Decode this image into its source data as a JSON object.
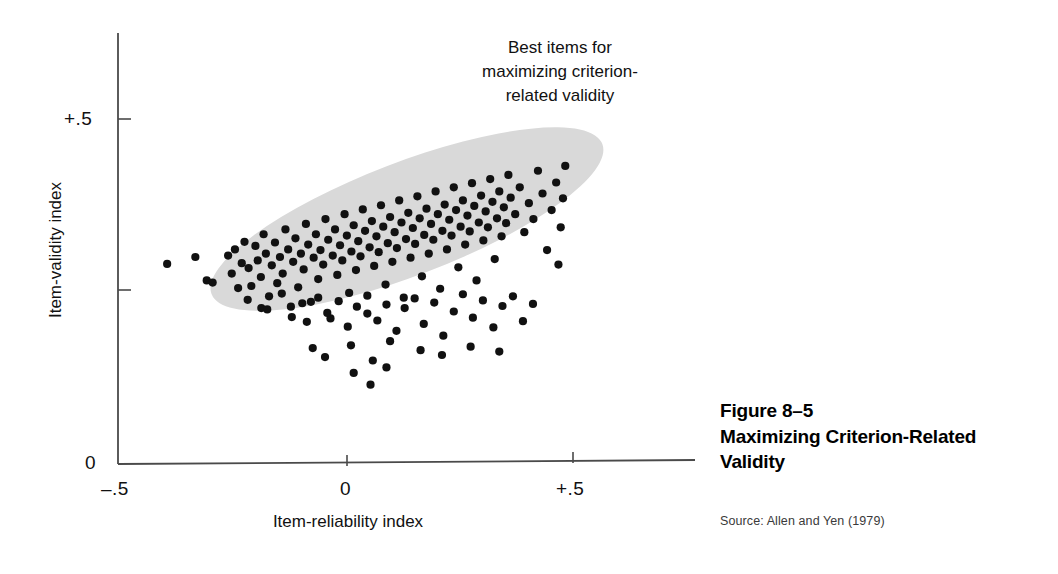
{
  "figure": {
    "caption_number": "Figure 8–5",
    "caption_title_line1": "Maximizing Criterion-Related",
    "caption_title_line2": "Validity",
    "source": "Source: Allen and Yen (1979)"
  },
  "annotation": {
    "line1": "Best items for",
    "line2": "maximizing criterion-",
    "line3": "related validity"
  },
  "axes": {
    "x_label": "Item-reliability index",
    "y_label": "Item-validity index",
    "x_ticks": [
      "–.5",
      "0",
      "+.5"
    ],
    "y_ticks": [
      "+.5",
      "0"
    ]
  },
  "colors": {
    "point": "#111111",
    "ellipse": "#d9d9d9",
    "axis": "#444444",
    "background": "#ffffff",
    "caption": "#000000",
    "source": "#3a3a3a"
  },
  "chart_data": {
    "type": "scatter",
    "title": "Maximizing Criterion-Related Validity",
    "xlabel": "Item-reliability index",
    "ylabel": "Item-validity index",
    "xlim": [
      -0.5,
      0.75
    ],
    "ylim": [
      0.0,
      0.6
    ],
    "x_tick_values": [
      -0.5,
      0.0,
      0.5
    ],
    "x_tick_labels": [
      "–.5",
      "0",
      "+.5"
    ],
    "y_tick_values": [
      0.0,
      0.5
    ],
    "y_tick_labels": [
      "0",
      "+.5"
    ],
    "grid": false,
    "legend": null,
    "annotations": [
      {
        "text": "Best items for maximizing criterion-related validity",
        "x": 0.45,
        "y": 0.62,
        "align": "center"
      }
    ],
    "highlight_region": {
      "shape": "ellipse",
      "label": "Best items for maximizing criterion-related validity",
      "fill": "#d9d9d9",
      "center_x": 0.135,
      "center_y": 0.355,
      "semi_major": 0.46,
      "semi_minor": 0.082,
      "rotation_deg": -21
    },
    "series": [
      {
        "name": "Test items",
        "marker": "circle",
        "color": "#111111",
        "n_points": 175,
        "points": [
          [
            -0.392,
            0.29
          ],
          [
            -0.33,
            0.3
          ],
          [
            -0.305,
            0.266
          ],
          [
            -0.292,
            0.263
          ],
          [
            -0.258,
            0.302
          ],
          [
            -0.25,
            0.276
          ],
          [
            -0.243,
            0.311
          ],
          [
            -0.236,
            0.255
          ],
          [
            -0.228,
            0.291
          ],
          [
            -0.222,
            0.322
          ],
          [
            -0.213,
            0.284
          ],
          [
            -0.207,
            0.258
          ],
          [
            -0.198,
            0.316
          ],
          [
            -0.193,
            0.295
          ],
          [
            -0.186,
            0.271
          ],
          [
            -0.18,
            0.333
          ],
          [
            -0.175,
            0.305
          ],
          [
            -0.168,
            0.243
          ],
          [
            -0.162,
            0.288
          ],
          [
            -0.155,
            0.321
          ],
          [
            -0.15,
            0.262
          ],
          [
            -0.144,
            0.3
          ],
          [
            -0.138,
            0.276
          ],
          [
            -0.132,
            0.34
          ],
          [
            -0.126,
            0.311
          ],
          [
            -0.12,
            0.228
          ],
          [
            -0.115,
            0.293
          ],
          [
            -0.11,
            0.327
          ],
          [
            -0.104,
            0.256
          ],
          [
            -0.098,
            0.305
          ],
          [
            -0.092,
            0.282
          ],
          [
            -0.087,
            0.348
          ],
          [
            -0.082,
            0.318
          ],
          [
            -0.076,
            0.235
          ],
          [
            -0.07,
            0.299
          ],
          [
            -0.065,
            0.333
          ],
          [
            -0.06,
            0.268
          ],
          [
            -0.055,
            0.31
          ],
          [
            -0.049,
            0.289
          ],
          [
            -0.044,
            0.355
          ],
          [
            -0.038,
            0.325
          ],
          [
            -0.033,
            0.211
          ],
          [
            -0.028,
            0.302
          ],
          [
            -0.023,
            0.34
          ],
          [
            -0.018,
            0.274
          ],
          [
            -0.012,
            0.317
          ],
          [
            -0.007,
            0.295
          ],
          [
            -0.002,
            0.362
          ],
          [
            0.003,
            0.331
          ],
          [
            0.008,
            0.248
          ],
          [
            0.013,
            0.308
          ],
          [
            0.018,
            0.346
          ],
          [
            0.023,
            0.281
          ],
          [
            0.028,
            0.323
          ],
          [
            0.033,
            0.301
          ],
          [
            0.038,
            0.369
          ],
          [
            0.043,
            0.338
          ],
          [
            0.048,
            0.218
          ],
          [
            0.053,
            0.314
          ],
          [
            0.058,
            0.352
          ],
          [
            0.063,
            0.287
          ],
          [
            0.068,
            0.33
          ],
          [
            0.073,
            0.307
          ],
          [
            0.078,
            0.375
          ],
          [
            0.083,
            0.344
          ],
          [
            0.088,
            0.26
          ],
          [
            0.093,
            0.32
          ],
          [
            0.098,
            0.358
          ],
          [
            0.103,
            0.293
          ],
          [
            0.108,
            0.336
          ],
          [
            0.113,
            0.313
          ],
          [
            0.118,
            0.382
          ],
          [
            0.123,
            0.35
          ],
          [
            0.128,
            0.241
          ],
          [
            0.133,
            0.326
          ],
          [
            0.138,
            0.364
          ],
          [
            0.143,
            0.299
          ],
          [
            0.148,
            0.342
          ],
          [
            0.153,
            0.319
          ],
          [
            0.158,
            0.388
          ],
          [
            0.163,
            0.356
          ],
          [
            0.168,
            0.272
          ],
          [
            0.173,
            0.332
          ],
          [
            0.178,
            0.37
          ],
          [
            0.183,
            0.305
          ],
          [
            0.188,
            0.348
          ],
          [
            0.193,
            0.325
          ],
          [
            0.198,
            0.395
          ],
          [
            0.203,
            0.362
          ],
          [
            0.208,
            0.254
          ],
          [
            0.213,
            0.338
          ],
          [
            0.218,
            0.376
          ],
          [
            0.223,
            0.311
          ],
          [
            0.228,
            0.354
          ],
          [
            0.233,
            0.331
          ],
          [
            0.238,
            0.401
          ],
          [
            0.243,
            0.368
          ],
          [
            0.248,
            0.285
          ],
          [
            0.253,
            0.344
          ],
          [
            0.258,
            0.382
          ],
          [
            0.263,
            0.318
          ],
          [
            0.268,
            0.36
          ],
          [
            0.273,
            0.337
          ],
          [
            0.278,
            0.407
          ],
          [
            0.283,
            0.374
          ],
          [
            0.288,
            0.266
          ],
          [
            0.293,
            0.35
          ],
          [
            0.298,
            0.389
          ],
          [
            0.303,
            0.324
          ],
          [
            0.308,
            0.366
          ],
          [
            0.313,
            0.343
          ],
          [
            0.318,
            0.413
          ],
          [
            0.323,
            0.38
          ],
          [
            0.328,
            0.297
          ],
          [
            0.333,
            0.356
          ],
          [
            0.338,
            0.395
          ],
          [
            0.343,
            0.33
          ],
          [
            0.348,
            0.372
          ],
          [
            0.353,
            0.349
          ],
          [
            0.358,
            0.419
          ],
          [
            0.363,
            0.386
          ],
          [
            0.373,
            0.362
          ],
          [
            0.383,
            0.401
          ],
          [
            0.393,
            0.336
          ],
          [
            0.403,
            0.378
          ],
          [
            0.413,
            0.355
          ],
          [
            0.423,
            0.425
          ],
          [
            0.433,
            0.392
          ],
          [
            0.443,
            0.31
          ],
          [
            0.453,
            0.368
          ],
          [
            0.463,
            0.408
          ],
          [
            0.473,
            0.343
          ],
          [
            0.483,
            0.432
          ],
          [
            0.478,
            0.385
          ],
          [
            0.468,
            0.289
          ],
          [
            -0.215,
            0.238
          ],
          [
            -0.185,
            0.226
          ],
          [
            -0.172,
            0.224
          ],
          [
            -0.14,
            0.247
          ],
          [
            -0.118,
            0.213
          ],
          [
            -0.095,
            0.233
          ],
          [
            -0.085,
            0.206
          ],
          [
            -0.06,
            0.241
          ],
          [
            -0.04,
            0.219
          ],
          [
            -0.015,
            0.236
          ],
          [
            0.005,
            0.199
          ],
          [
            0.025,
            0.228
          ],
          [
            0.048,
            0.244
          ],
          [
            0.07,
            0.208
          ],
          [
            0.09,
            0.231
          ],
          [
            0.112,
            0.193
          ],
          [
            0.13,
            0.226
          ],
          [
            0.152,
            0.24
          ],
          [
            0.172,
            0.203
          ],
          [
            0.195,
            0.234
          ],
          [
            0.215,
            0.186
          ],
          [
            0.238,
            0.221
          ],
          [
            0.258,
            0.246
          ],
          [
            0.28,
            0.212
          ],
          [
            0.302,
            0.237
          ],
          [
            0.325,
            0.198
          ],
          [
            0.345,
            0.229
          ],
          [
            0.368,
            0.243
          ],
          [
            0.39,
            0.207
          ],
          [
            0.412,
            0.232
          ],
          [
            -0.072,
            0.168
          ],
          [
            -0.045,
            0.155
          ],
          [
            0.012,
            0.172
          ],
          [
            0.06,
            0.15
          ],
          [
            0.098,
            0.178
          ],
          [
            0.018,
            0.132
          ],
          [
            0.09,
            0.14
          ],
          [
            0.055,
            0.115
          ],
          [
            0.165,
            0.165
          ],
          [
            0.212,
            0.158
          ],
          [
            0.275,
            0.17
          ],
          [
            0.338,
            0.163
          ]
        ]
      }
    ]
  }
}
